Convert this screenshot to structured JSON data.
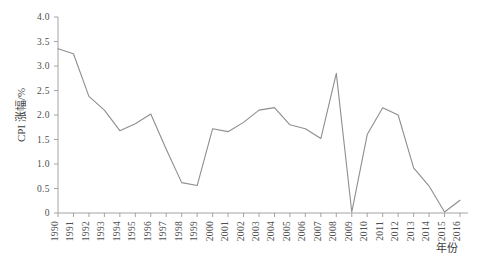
{
  "chart_data": {
    "type": "line",
    "title": "",
    "subtitle": "",
    "xlabel": "年份",
    "ylabel": "CPI 涨幅/%",
    "xlim": [
      1990,
      2016
    ],
    "ylim": [
      0,
      4.0
    ],
    "grid": false,
    "legend": null,
    "legend_position": "none",
    "y_ticks": [
      "0",
      "0.5",
      "1.0",
      "1.5",
      "2.0",
      "2.5",
      "3.0",
      "3.5",
      "4.0"
    ],
    "y_tick_values": [
      0,
      0.5,
      1.0,
      1.5,
      2.0,
      2.5,
      3.0,
      3.5,
      4.0
    ],
    "categories": [
      "1990",
      "1991",
      "1992",
      "1993",
      "1994",
      "1995",
      "1996",
      "1997",
      "1998",
      "1999",
      "2000",
      "2001",
      "2002",
      "2003",
      "2004",
      "2005",
      "2006",
      "2007",
      "2008",
      "2009",
      "2010",
      "2011",
      "2012",
      "2013",
      "2014",
      "2015",
      "2016"
    ],
    "values": [
      3.35,
      3.25,
      2.38,
      2.1,
      1.68,
      1.82,
      2.02,
      1.3,
      0.62,
      0.56,
      1.72,
      1.66,
      1.85,
      2.1,
      2.15,
      1.8,
      1.72,
      1.52,
      2.85,
      0.02,
      1.6,
      2.15,
      2.0,
      0.92,
      0.55,
      0.02,
      0.26
    ],
    "series": [
      {
        "name": "CPI 涨幅",
        "color": "#8e8e8e",
        "values": [
          3.35,
          3.25,
          2.38,
          2.1,
          1.68,
          1.82,
          2.02,
          1.3,
          0.62,
          0.56,
          1.72,
          1.66,
          1.85,
          2.1,
          2.15,
          1.8,
          1.72,
          1.52,
          2.85,
          0.02,
          1.6,
          2.15,
          2.0,
          0.92,
          0.55,
          0.02,
          0.26
        ]
      }
    ]
  },
  "axes": {
    "y_axis_label": "CPI 涨幅/%",
    "x_axis_label": "年份"
  },
  "colors": {
    "line": "#8e8e8e",
    "axis": "#9a9a9a",
    "text": "#4f4f4f",
    "background": "#ffffff"
  }
}
